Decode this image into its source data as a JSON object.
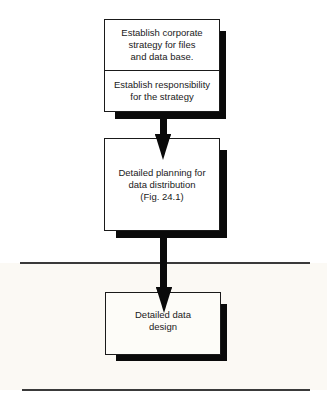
{
  "diagram": {
    "type": "flowchart",
    "nodes": [
      {
        "id": "strategy",
        "sections": [
          "Establish corporate\nstrategy for files\nand data base.",
          "Establish responsibility\nfor the strategy"
        ]
      },
      {
        "id": "planning",
        "sections": [
          "Detailed planning for\ndata distribution\n(Fig. 24.1)"
        ]
      },
      {
        "id": "design",
        "sections": [
          "Detailed data\ndesign"
        ]
      }
    ],
    "edges": [
      {
        "from": "strategy",
        "to": "planning"
      },
      {
        "from": "planning",
        "to": "design"
      }
    ],
    "colors": {
      "ink": "#0a0a0a",
      "band": "#fbf9f4",
      "rule": "#3a3a3a"
    }
  }
}
